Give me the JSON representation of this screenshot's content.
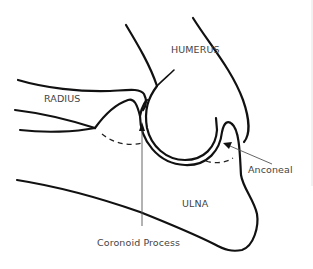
{
  "diagram": {
    "labels": {
      "humerus": "HUMERUS",
      "radius": "RADIUS",
      "ulna": "ULNA",
      "anconeal": "Anconeal",
      "coronoid": "Coronoid Process"
    },
    "structures": [
      {
        "name": "humerus",
        "label": "HUMERUS"
      },
      {
        "name": "radius",
        "label": "RADIUS"
      },
      {
        "name": "ulna",
        "label": "ULNA"
      }
    ],
    "annotations": [
      {
        "name": "anconeal-process",
        "label": "Anconeal",
        "pointer": "arrow"
      },
      {
        "name": "coronoid-process",
        "label": "Coronoid Process",
        "pointer": "arrow"
      }
    ],
    "colors": {
      "line": "#111111",
      "text": "#444444",
      "pointer": "#555555",
      "background": "#ffffff"
    }
  }
}
